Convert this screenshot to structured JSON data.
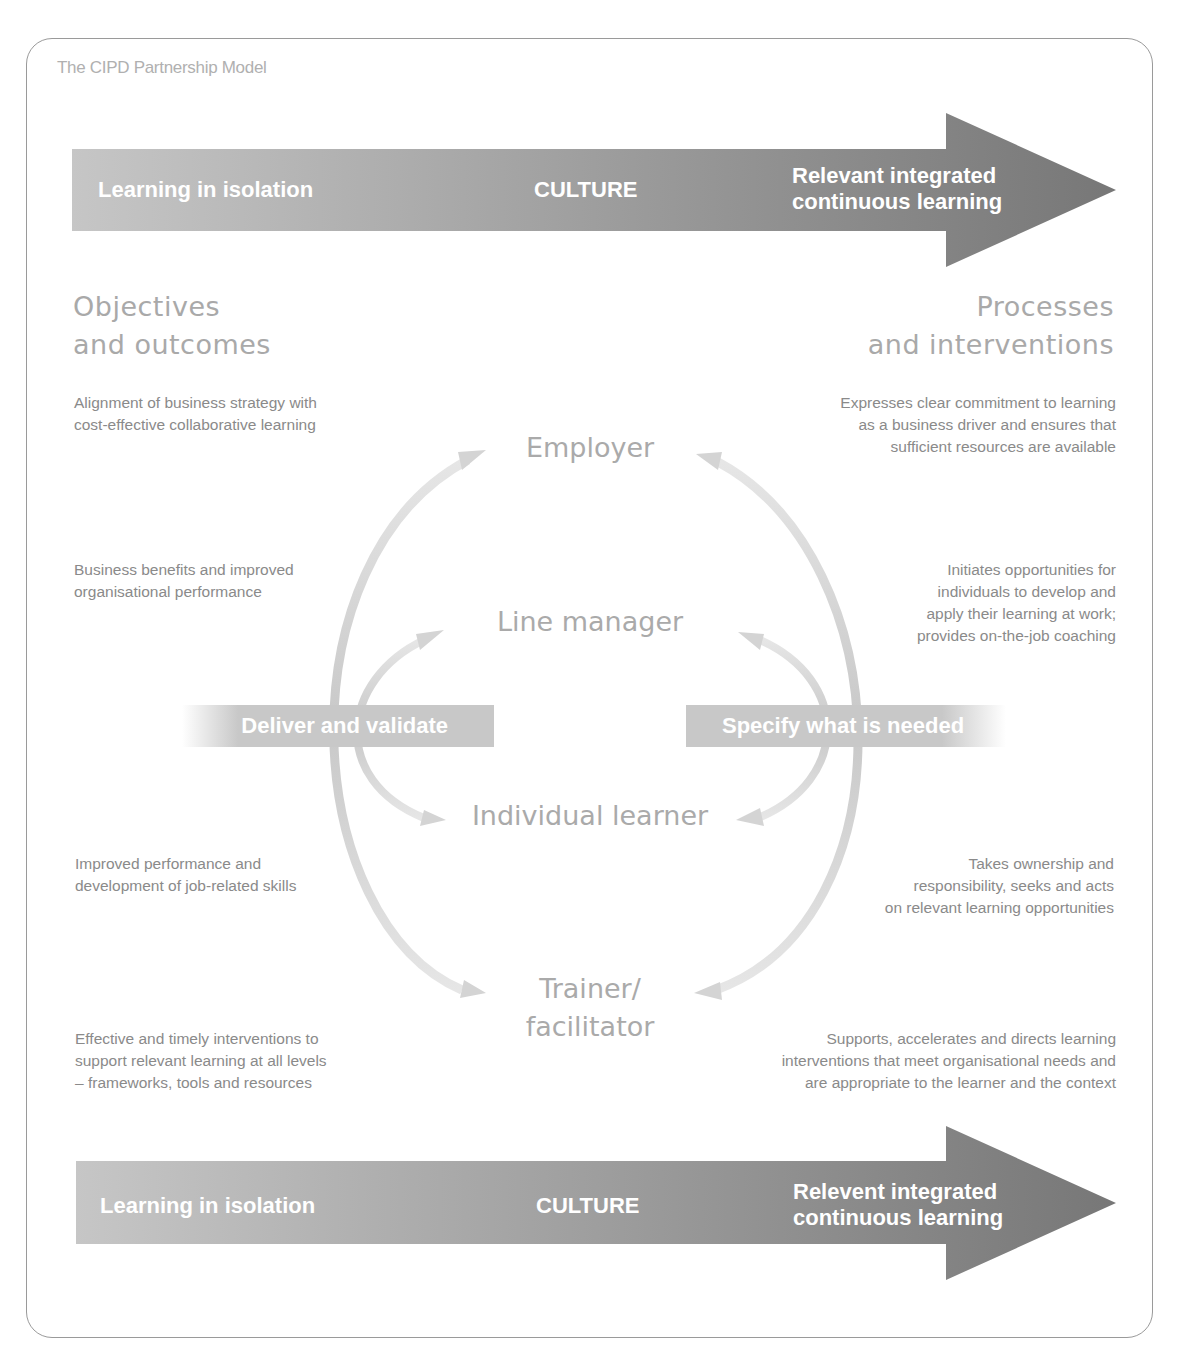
{
  "caption": "The CIPD Partnership Model",
  "top_band": {
    "left_label": "Learning in isolation",
    "center_label": "CULTURE",
    "right_label_line1": "Relevant integrated",
    "right_label_line2": "continuous learning"
  },
  "bottom_band": {
    "left_label": "Learning in isolation",
    "center_label": "CULTURE",
    "right_label_line1": "Relevent integrated",
    "right_label_line2": "continuous learning"
  },
  "left_column": {
    "heading_line1": "Objectives",
    "heading_line2": "and outcomes",
    "items": [
      {
        "line1": "Alignment of business strategy with",
        "line2": "cost-effective collaborative learning"
      },
      {
        "line1": "Business benefits and improved",
        "line2": "organisational performance"
      },
      {
        "line1": "Improved performance and",
        "line2": "development of job-related skills"
      },
      {
        "line1": "Effective and timely interventions to",
        "line2": "support relevant learning at all levels",
        "line3": "– frameworks, tools and resources"
      }
    ]
  },
  "right_column": {
    "heading_line1": "Processes",
    "heading_line2": "and interventions",
    "items": [
      {
        "line1": "Expresses clear commitment to learning",
        "line2": "as a business driver and ensures that",
        "line3": "sufficient resources are available"
      },
      {
        "line1": "Initiates opportunities for",
        "line2": "individuals to develop and",
        "line3": "apply their learning at work;",
        "line4": "provides on-the-job coaching"
      },
      {
        "line1": "Takes ownership and",
        "line2": "responsibility, seeks and acts",
        "line3": "on relevant learning opportunities"
      },
      {
        "line1": "Supports, accelerates and directs learning",
        "line2": "interventions that meet organisational needs and",
        "line3": "are appropriate to the learner and the context"
      }
    ]
  },
  "roles": {
    "employer": "Employer",
    "line_manager": "Line manager",
    "individual_learner": "Individual learner",
    "trainer_line1": "Trainer/",
    "trainer_line2": "facilitator"
  },
  "middle_bands": {
    "left": "Deliver and validate",
    "right": "Specify what is needed"
  },
  "colors": {
    "band_light": "#c4c4c4",
    "band_dark": "#7a7a7a",
    "arc": "#cfcfcf",
    "heading": "#a9a9a9",
    "body_text": "#8a8a8a"
  }
}
